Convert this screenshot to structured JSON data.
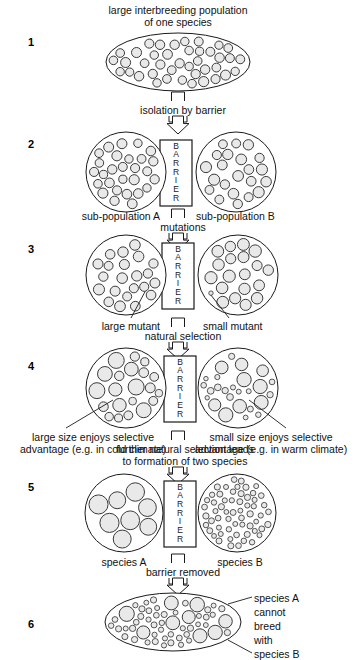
{
  "figure": {
    "background_color": "#ffffff",
    "ink_color": "#1a1a1a",
    "cell_fill_color": "#e9e9e9",
    "cell_stroke_color": "#3a3a3a"
  },
  "headline": {
    "line1": "large interbreeding population",
    "line2": "of one species"
  },
  "steps": [
    {
      "number": "1"
    },
    {
      "number": "2"
    },
    {
      "number": "3"
    },
    {
      "number": "4"
    },
    {
      "number": "5"
    },
    {
      "number": "6"
    }
  ],
  "barrier": {
    "text": "BARRIER",
    "letters": [
      "B",
      "A",
      "R",
      "R",
      "I",
      "E",
      "R"
    ]
  },
  "transitions": [
    {
      "label": "isolation by barrier"
    },
    {
      "label": "mutations"
    },
    {
      "label": "natural selection"
    },
    {
      "label_line1": "further natural selection leads",
      "label_line2": "to formation of two species"
    },
    {
      "label": "barrier removed"
    }
  ],
  "labels": {
    "sub_population_a": "sub-population A",
    "sub_population_b": "sub-population B",
    "large_mutant": "large mutant",
    "small_mutant": "small mutant",
    "large_advantage_line1": "large size enjoys selective",
    "large_advantage_line2": "advantage (e.g. in cold climate)",
    "small_advantage_line1": "small size enjoys selective",
    "small_advantage_line2": "advantage (e.g. in warm climate)",
    "species_a": "species A",
    "species_b": "species B",
    "final_line1": "species A",
    "final_line2": "cannot",
    "final_line3": "breed",
    "final_line4": "with",
    "final_line5": "species B"
  },
  "populations": {
    "stage1": {
      "shape": "ellipse",
      "cx": 178,
      "cy": 62,
      "rx": 72,
      "ry": 29,
      "cells": "uniform-small",
      "count": 54,
      "radius": 4.6,
      "radius_jitter": 0.5
    },
    "stage2_left": {
      "shape": "circle",
      "cx": 126,
      "cy": 172,
      "r": 40,
      "cells": "uniform-small",
      "count": 34,
      "radius": 4.6,
      "radius_jitter": 0.5
    },
    "stage2_right": {
      "shape": "circle",
      "cx": 236,
      "cy": 172,
      "r": 40,
      "cells": "uniform-small",
      "count": 31,
      "radius": 5.0,
      "radius_jitter": 0.6
    },
    "stage3_left": {
      "shape": "circle",
      "cx": 126,
      "cy": 275,
      "r": 40,
      "cells": "one-large-mutant",
      "count": 31,
      "radius": 5.0,
      "radius_jitter": 0.6,
      "mutant_radius": 8.5
    },
    "stage3_right": {
      "shape": "circle",
      "cx": 238,
      "cy": 275,
      "r": 40,
      "cells": "one-small-mutant",
      "count": 29,
      "radius": 5.6,
      "radius_jitter": 0.6,
      "mutant_radius": 2.2
    },
    "stage4_left": {
      "shape": "circle",
      "cx": 126,
      "cy": 388,
      "r": 40,
      "cells": "mixed-large-biased",
      "count": 33,
      "radius": 5.2,
      "radius_jitter": 2.2
    },
    "stage4_right": {
      "shape": "circle",
      "cx": 238,
      "cy": 388,
      "r": 40,
      "cells": "mixed-small-biased",
      "count": 33,
      "radius": 4.6,
      "radius_jitter": 2.4
    },
    "stage5_left": {
      "shape": "circle",
      "cx": 124,
      "cy": 513,
      "r": 39,
      "cells": "uniform-large",
      "count": 16,
      "radius": 9.0,
      "radius_jitter": 0.6
    },
    "stage5_right": {
      "shape": "circle",
      "cx": 237,
      "cy": 513,
      "r": 39,
      "cells": "uniform-tiny",
      "count": 62,
      "radius": 2.8,
      "radius_jitter": 0.4
    },
    "stage6": {
      "shape": "ellipse",
      "cx": 173,
      "cy": 622,
      "rx": 68,
      "ry": 29,
      "cells": "two-species-mixed",
      "count_large": 22,
      "radius_large": 7.2,
      "count_small": 52,
      "radius_small": 2.8
    }
  }
}
